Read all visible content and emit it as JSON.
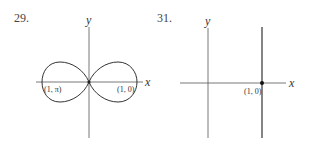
{
  "figures": [
    {
      "number": "29.",
      "x_axis_label": "x",
      "y_axis_label": "y",
      "curve": "figure-eight (lemniscate-like) through origin",
      "points": [
        {
          "label": "(1, π)",
          "position": "left lobe intercept"
        },
        {
          "label": "(1, 0)",
          "position": "right lobe intercept"
        }
      ]
    },
    {
      "number": "31.",
      "x_axis_label": "x",
      "y_axis_label": "y",
      "curve": "vertical line x = 1",
      "points": [
        {
          "label": "(1, 0)",
          "position": "intersection with x-axis"
        }
      ]
    }
  ],
  "colors": {
    "ink": "#2a2a2a",
    "background": "#ffffff"
  }
}
